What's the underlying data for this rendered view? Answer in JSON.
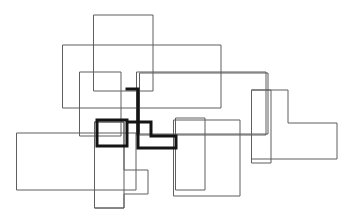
{
  "figure": {
    "canvas": {
      "width": 354,
      "height": 218,
      "background_color": "#ffffff"
    },
    "stroke_styles": {
      "thin_color": "#5f5f5f",
      "thin_width": 1,
      "bold_color": "#141414",
      "bold_width": 3
    },
    "shapes": [
      {
        "id": "shape-top-rect",
        "name": "top-center-rectangle",
        "style": "thin",
        "kind": "rectangle",
        "points": "94,15 153,15 153,91 94,91"
      },
      {
        "id": "shape-wide-upper-rect",
        "name": "wide-upper-rectangle",
        "style": "thin",
        "kind": "rectangle",
        "points": "63,45 221,45 221,108 63,108"
      },
      {
        "id": "shape-mid-left-rect",
        "name": "mid-left-rectangle",
        "style": "thin",
        "kind": "rectangle",
        "points": "80,72 121,72 121,136 80,136"
      },
      {
        "id": "shape-wide-mid-rect",
        "name": "wide-middle-rectangle",
        "style": "thin",
        "kind": "rectangle",
        "points": "137,72 266,72 266,135 137,135"
      },
      {
        "id": "shape-left-wide-rect",
        "name": "lower-left-wide-rectangle",
        "style": "thin",
        "kind": "rectangle",
        "points": "17,133 136,133 136,190 17,190"
      },
      {
        "id": "shape-bottom-left-tall-rect",
        "name": "bottom-left-tall-rectangle",
        "style": "thin",
        "kind": "rectangle",
        "points": "95,122 124,122 124,208 95,208"
      },
      {
        "id": "shape-lower-step-polygon",
        "name": "lower-step-polygon",
        "style": "thin",
        "kind": "polygon",
        "points": "95,122 124,122 124,170 148,170 148,194 124,194 124,208 95,208"
      },
      {
        "id": "shape-bottom-center-rect",
        "name": "bottom-center-rectangle",
        "style": "thin",
        "kind": "rectangle",
        "points": "176,118 205,118 205,190 176,190"
      },
      {
        "id": "shape-center-right-rect",
        "name": "center-right-rectangle",
        "style": "thin",
        "kind": "rectangle",
        "points": "174,120 240,120 240,196 174,196"
      },
      {
        "id": "shape-right-tall-rect",
        "name": "right-tall-rectangle",
        "style": "thin",
        "kind": "rectangle",
        "points": "252,90 271,90 271,163 252,163"
      },
      {
        "id": "shape-right-L-polygon",
        "name": "right-L-shaped-polygon",
        "style": "thin",
        "kind": "polygon",
        "points": "252,90 288,90 288,123 337,123 337,159 252,159"
      },
      {
        "id": "shape-right-upper-rect",
        "name": "right-upper-rectangle",
        "style": "thin",
        "kind": "rectangle",
        "points": "140,73 268,73 268,134 140,134"
      },
      {
        "id": "shape-center-bold-polygon",
        "name": "bold-step-polygon",
        "style": "bold",
        "kind": "polygon",
        "points": "127,89 138,89 138,122 151,122 151,136 176,136 176,148 138,148 138,122 127,122 127,146 97,146 97,120 127,120"
      }
    ],
    "bold_shape_outline": {
      "name": "highlighted-target-shape",
      "stroke_color": "#141414",
      "segments": [
        "127,89 to 138,89",
        "138,89 to 138,120",
        "138,120 to 151,120",
        "151,120 to 151,136",
        "151,136 to 176,136",
        "176,136 to 176,148",
        "176,148 to 138,148",
        "138,148 to 138,120",
        "127,120 to 127,146",
        "127,146 to 97,146",
        "97,146 to 97,120",
        "97,120 to 127,120"
      ]
    }
  }
}
